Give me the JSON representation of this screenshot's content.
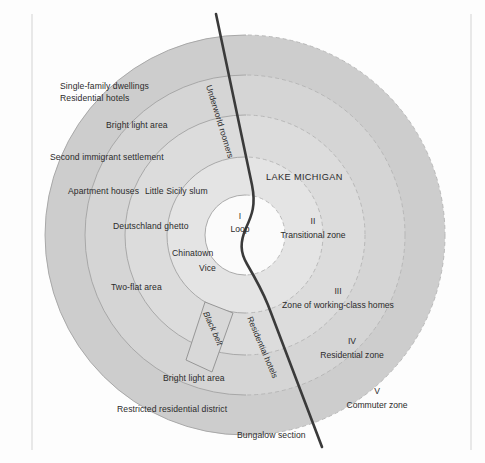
{
  "figure": {
    "background_color": "#fdfdfd",
    "border_color": "#d8d8d8"
  },
  "colors": {
    "ring1": "#ffffff",
    "ring2": "#e3e3e3",
    "ring3": "#dcdcdc",
    "ring4": "#d4d4d4",
    "ring5": "#cccccc",
    "arc_solid": "#9a9a9a",
    "arc_dashed": "#b0b0b0",
    "shoreline": "#3a3a3a",
    "text": "#2b2b2b"
  },
  "water": {
    "label": "LAKE MICHIGAN"
  },
  "zones": [
    {
      "numeral": "I",
      "name": "Loop"
    },
    {
      "numeral": "II",
      "name": "Transitional zone"
    },
    {
      "numeral": "III",
      "name": "Zone of working-class homes"
    },
    {
      "numeral": "IV",
      "name": "Residential zone"
    },
    {
      "numeral": "V",
      "name": "Commuter zone"
    }
  ],
  "district_labels": [
    {
      "text": "Single-family dwellings"
    },
    {
      "text": "Residential hotels"
    },
    {
      "text": "Bright light area"
    },
    {
      "text": "Second immigrant settlement"
    },
    {
      "text": "Apartment houses"
    },
    {
      "text": "Little Sicily slum"
    },
    {
      "text": "Deutschland ghetto"
    },
    {
      "text": "Chinatown"
    },
    {
      "text": "Vice"
    },
    {
      "text": "Two-flat area"
    },
    {
      "text": "Bright light area"
    },
    {
      "text": "Restricted residential district"
    },
    {
      "text": "Bungalow section"
    }
  ],
  "rotated_labels": [
    {
      "text": "Underworld roomers"
    },
    {
      "text": "Black belt"
    },
    {
      "text": "Residential hotels"
    }
  ]
}
